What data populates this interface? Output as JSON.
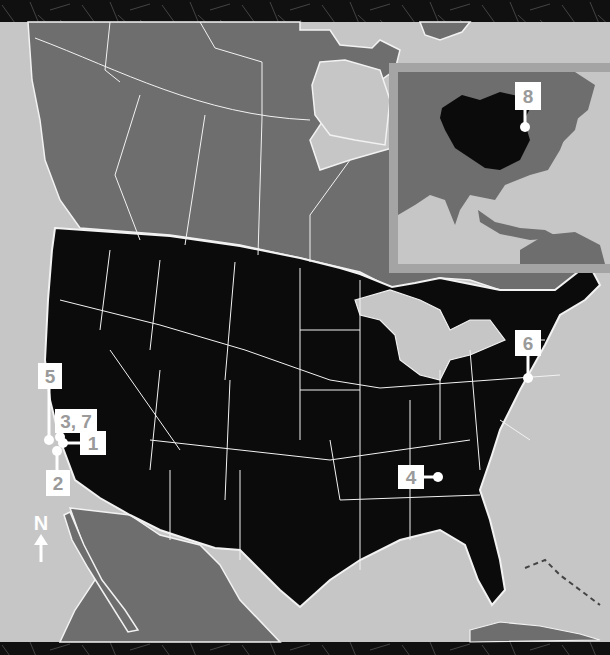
{
  "map": {
    "title": "Site locations map",
    "region": "North America with Asia inset",
    "compass": {
      "letter": "N",
      "icon": "north-arrow-icon"
    },
    "colors": {
      "ocean": "#c6c6c6",
      "usa": "#0b0b0b",
      "other_land": "#6e6e6e",
      "borders": "#f2f2f2",
      "marker_box": "#ffffff",
      "marker_text": "#9a9a9a",
      "inset_frame": "#a4a4a4",
      "frame_band": "#111111"
    },
    "markers": [
      {
        "label": "1",
        "location": "California (central coast)"
      },
      {
        "label": "2",
        "location": "California (south coast)"
      },
      {
        "label": "3, 7",
        "location": "California (central)"
      },
      {
        "label": "4",
        "location": "Georgia"
      },
      {
        "label": "5",
        "location": "California (north coast)"
      },
      {
        "label": "6",
        "location": "New York / New Jersey"
      },
      {
        "label": "8",
        "location": "Beijing, China"
      }
    ],
    "inset": {
      "title": "East Asia inset",
      "highlighted_country": "China"
    }
  }
}
